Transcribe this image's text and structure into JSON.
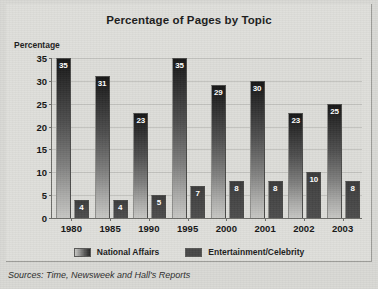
{
  "chart_data": {
    "type": "bar",
    "title": "Percentage of Pages by Topic",
    "xlabel": "",
    "ylabel": "Percentage",
    "categories": [
      "1980",
      "1985",
      "1990",
      "1995",
      "2000",
      "2001",
      "2002",
      "2003"
    ],
    "series": [
      {
        "name": "National Affairs",
        "values": [
          35,
          31,
          23,
          35,
          29,
          30,
          23,
          25
        ],
        "color": "#1a1a1a"
      },
      {
        "name": "Entertainment/Celebrity",
        "values": [
          4,
          4,
          5,
          7,
          8,
          8,
          10,
          8
        ],
        "color": "#474747"
      }
    ],
    "ylim": [
      0,
      35
    ],
    "yticks": [
      0,
      5,
      10,
      15,
      20,
      25,
      30,
      35
    ],
    "ytick_labels": [
      "0",
      "5",
      "10",
      "15",
      "20",
      "25",
      "30",
      "35"
    ],
    "grid": true,
    "legend_position": "bottom",
    "data_labels": true
  },
  "source_note": {
    "prefix": "Sources:",
    "text": "Sources: Time, Newsweek and Hall's Reports"
  },
  "colors": {
    "background": "#d8d8d4",
    "plot_background": "#dcdcd8",
    "axis": "#6e6e6a",
    "gridline": "#c2c2be",
    "text": "#141414"
  }
}
